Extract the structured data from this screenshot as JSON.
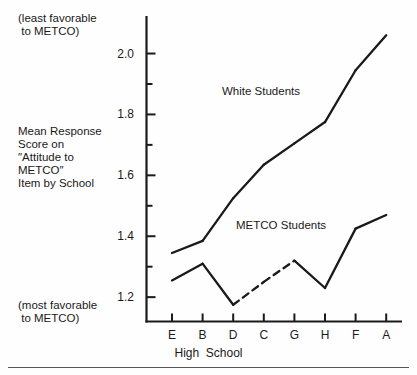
{
  "annotations": {
    "least_favorable": "(least favorable\n to METCO)",
    "most_favorable": "(most favorable\n to METCO)"
  },
  "axis": {
    "y_label": "Mean Response\nScore on\n″Attitude to\nMETCO″\nItem by School",
    "x_title": "High  School"
  },
  "chart_data": {
    "type": "line",
    "title": "",
    "subtitle": "",
    "xlabel": "High  School",
    "ylabel": "Mean Response Score on ″Attitude to METCO″ Item by School",
    "categories": [
      "E",
      "B",
      "D",
      "C",
      "G",
      "H",
      "F",
      "A"
    ],
    "x": [
      1,
      2,
      3,
      4,
      5,
      6,
      7,
      8
    ],
    "ylim": [
      1.12,
      2.12
    ],
    "xlim": [
      0.55,
      8.45
    ],
    "yticks_major": [
      "1.2",
      "1.4",
      "1.6",
      "1.8",
      "2.0"
    ],
    "yticks_major_values": [
      1.2,
      1.4,
      1.6,
      1.8,
      2.0
    ],
    "yticks_minor_values": [
      1.3,
      1.5,
      1.7,
      1.9
    ],
    "grid": false,
    "legend_position": "inline-annotations",
    "series": [
      {
        "name": "White Students",
        "values": [
          1.345,
          1.385,
          1.525,
          1.635,
          1.705,
          1.775,
          1.945,
          2.06
        ],
        "style": "solid",
        "label_text": "White Students"
      },
      {
        "name": "METCO Students",
        "values": [
          1.255,
          1.31,
          1.175,
          1.25,
          1.32,
          1.23,
          1.425,
          1.47
        ],
        "style": "mixed",
        "dashed_segment": [
          "D",
          "C",
          "G"
        ],
        "label_text": "METCO Students"
      }
    ],
    "annotations": [
      {
        "text": "(least favorable to METCO)",
        "position": "top-left"
      },
      {
        "text": "(most favorable to METCO)",
        "position": "bottom-left"
      }
    ]
  },
  "colors": {
    "line": "#1a1a1a",
    "axis": "#1a1a1a",
    "background": "#fefefe",
    "rule": "#555555"
  }
}
